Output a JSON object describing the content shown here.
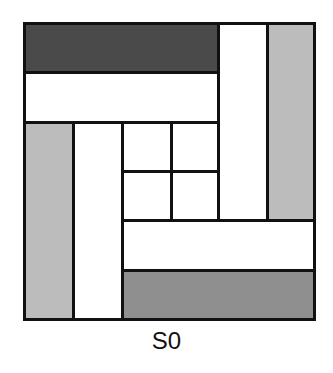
{
  "diagram": {
    "caption": "S0",
    "colors": {
      "dark": "#4a4a4a",
      "medium": "#8f8f8f",
      "light": "#bcbcbc",
      "white": "#ffffff",
      "outline": "#111111"
    },
    "blocks": [
      {
        "id": "top-dark-bar",
        "x": 23,
        "y": 22,
        "w": 197,
        "h": 52,
        "fill": "dark"
      },
      {
        "id": "top-white-bar",
        "x": 23,
        "y": 71,
        "w": 197,
        "h": 53,
        "fill": "white"
      },
      {
        "id": "right-white-column",
        "x": 217,
        "y": 22,
        "w": 52,
        "h": 200,
        "fill": "white"
      },
      {
        "id": "right-light-column",
        "x": 266,
        "y": 22,
        "w": 50,
        "h": 200,
        "fill": "light"
      },
      {
        "id": "left-light-column",
        "x": 23,
        "y": 121,
        "w": 52,
        "h": 200,
        "fill": "light"
      },
      {
        "id": "left-white-column",
        "x": 72,
        "y": 121,
        "w": 52,
        "h": 200,
        "fill": "white"
      },
      {
        "id": "bottom-white-bar",
        "x": 121,
        "y": 219,
        "w": 195,
        "h": 53,
        "fill": "white"
      },
      {
        "id": "bottom-medium-bar",
        "x": 121,
        "y": 269,
        "w": 195,
        "h": 52,
        "fill": "medium"
      },
      {
        "id": "center-cell-top-left",
        "x": 121,
        "y": 121,
        "w": 52,
        "h": 52,
        "fill": "white"
      },
      {
        "id": "center-cell-top-right",
        "x": 170,
        "y": 121,
        "w": 50,
        "h": 52,
        "fill": "white"
      },
      {
        "id": "center-cell-bottom-left",
        "x": 121,
        "y": 170,
        "w": 52,
        "h": 52,
        "fill": "white"
      },
      {
        "id": "center-cell-bottom-right",
        "x": 170,
        "y": 170,
        "w": 50,
        "h": 52,
        "fill": "white"
      }
    ]
  }
}
